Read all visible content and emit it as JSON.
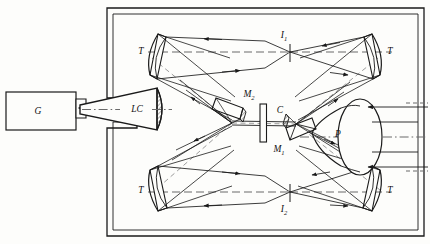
{
  "diagram": {
    "background_color": "#fdfdfb",
    "line_color": "#1a1a1a",
    "axis_color": "#555555"
  },
  "labels": {
    "source": "G",
    "light_cone": "LC",
    "mirror_upper": "M",
    "mirror_upper_sub": "2",
    "mirror_lower": "M",
    "mirror_lower_sub": "1",
    "cell": "C",
    "image_top": "I",
    "image_top_sub": "1",
    "image_bottom": "I",
    "image_bottom_sub": "2",
    "paraboloid": "P",
    "mirror_tl": "T",
    "mirror_tr": "T",
    "mirror_bl": "T",
    "mirror_br": "T"
  },
  "components": [
    {
      "name": "source-box",
      "label": "G",
      "role": "generator"
    },
    {
      "name": "light-cone",
      "label": "LC",
      "role": "collimating cone"
    },
    {
      "name": "telescope-mirror-top-left",
      "label": "T",
      "role": "concave mirror"
    },
    {
      "name": "telescope-mirror-top-right",
      "label": "T",
      "role": "concave mirror"
    },
    {
      "name": "telescope-mirror-bottom-left",
      "label": "T",
      "role": "concave mirror"
    },
    {
      "name": "telescope-mirror-bottom-right",
      "label": "T",
      "role": "concave mirror"
    },
    {
      "name": "fold-mirror-m2",
      "label": "M2",
      "role": "fold mirror"
    },
    {
      "name": "fold-mirror-m1",
      "label": "M1",
      "role": "fold mirror"
    },
    {
      "name": "sample-cell",
      "label": "C",
      "role": "sample cell"
    },
    {
      "name": "image-point-i1",
      "label": "I1",
      "role": "intermediate image"
    },
    {
      "name": "image-point-i2",
      "label": "I2",
      "role": "intermediate image"
    },
    {
      "name": "paraboloid-p",
      "label": "P",
      "role": "paraboloid collector"
    }
  ]
}
